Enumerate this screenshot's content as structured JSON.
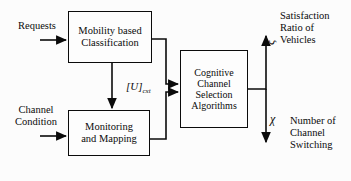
{
  "diagram": {
    "stroke_color": "#0b0b0b",
    "background_color": "#fcfcfc",
    "boxes": [
      {
        "id": "mobility",
        "line1": "Mobility based",
        "line2": "Classification"
      },
      {
        "id": "monitoring",
        "line1": "Monitoring",
        "line2": "and Mapping"
      },
      {
        "id": "cognitive",
        "line1": "Cognitive",
        "line2": "Channel",
        "line3": "Selection",
        "line4": "Algorithms"
      }
    ],
    "inputs": [
      {
        "id": "requests",
        "line1": "Requests"
      },
      {
        "id": "channel-condition",
        "line1": "Channel",
        "line2": "Condition"
      }
    ],
    "outputs": [
      {
        "id": "satisfaction",
        "symbol": "ξ",
        "line1": "Satisfaction",
        "line2": "Ratio of",
        "line3": "Vehicles"
      },
      {
        "id": "switching",
        "symbol": "χ",
        "line1": "Number of",
        "line2": "Channel",
        "line3": "Switching"
      }
    ],
    "edge_labels": [
      {
        "id": "utility-matrix",
        "base": "[U]",
        "subscript": "cxt"
      }
    ]
  }
}
